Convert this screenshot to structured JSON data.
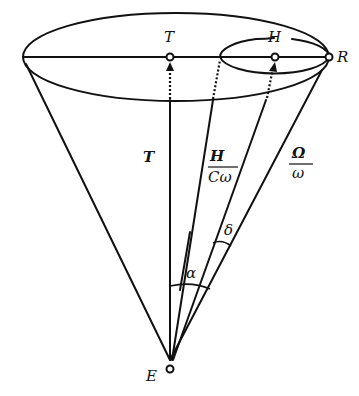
{
  "diagram": {
    "points": {
      "T": {
        "label": "T"
      },
      "H": {
        "label": "H"
      },
      "R": {
        "label": "R"
      },
      "E": {
        "label": "E"
      }
    },
    "vectors": {
      "T_axis": {
        "label": "T"
      },
      "H_vec": {
        "numerator": "H",
        "denominator": "Cω"
      },
      "Omega_vec": {
        "numerator": "Ω",
        "denominator": "ω"
      }
    },
    "angles": {
      "alpha": {
        "label": "α"
      },
      "delta": {
        "label": "δ"
      }
    },
    "colors": {
      "stroke": "#111111",
      "background": "#ffffff"
    }
  }
}
